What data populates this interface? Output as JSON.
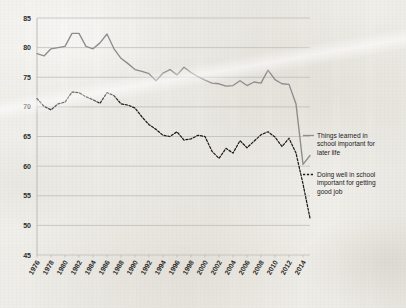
{
  "chart_data": {
    "type": "line",
    "title": "",
    "xlabel": "",
    "ylabel": "",
    "xlim": [
      1976,
      2015
    ],
    "ylim": [
      45,
      85
    ],
    "ytick_step": 5,
    "grid": true,
    "legend_position": "right",
    "yticks": [
      "45",
      "50",
      "55",
      "60",
      "65",
      "70",
      "75",
      "80",
      "85"
    ],
    "xticks": [
      "1976",
      "1978",
      "1980",
      "1982",
      "1984",
      "1986",
      "1988",
      "1990",
      "1992",
      "1994",
      "1996",
      "1998",
      "2000",
      "2002",
      "2004",
      "2006",
      "2008",
      "2010",
      "2012",
      "2014"
    ],
    "x": [
      1976,
      1977,
      1978,
      1979,
      1980,
      1981,
      1982,
      1983,
      1984,
      1985,
      1986,
      1987,
      1988,
      1989,
      1990,
      1991,
      1992,
      1993,
      1994,
      1995,
      1996,
      1997,
      1998,
      1999,
      2000,
      2001,
      2002,
      2003,
      2004,
      2005,
      2006,
      2007,
      2008,
      2009,
      2010,
      2011,
      2012,
      2013,
      2014,
      2015
    ],
    "series": [
      {
        "name": "Things learned in school important for later life",
        "style": "solid",
        "color": "#8d8d8d",
        "values": [
          79.0,
          78.6,
          79.8,
          80.0,
          80.2,
          82.4,
          82.4,
          80.2,
          79.8,
          80.8,
          82.3,
          79.8,
          78.2,
          77.3,
          76.3,
          76.0,
          75.6,
          74.4,
          75.7,
          76.3,
          75.4,
          76.7,
          75.8,
          75.1,
          74.5,
          74.0,
          73.9,
          73.5,
          73.6,
          74.4,
          73.6,
          74.2,
          74.0,
          76.2,
          74.6,
          73.9,
          73.8,
          70.5,
          60.3,
          61.8
        ]
      },
      {
        "name": "Doing well in school important for getting good job",
        "style": "dashed",
        "color": "#1f1d1c",
        "values": [
          71.4,
          70.1,
          69.5,
          70.5,
          70.8,
          72.5,
          72.4,
          71.7,
          71.2,
          70.6,
          72.4,
          71.9,
          70.5,
          70.3,
          69.8,
          68.3,
          67.0,
          66.2,
          65.2,
          65.0,
          65.8,
          64.4,
          64.6,
          65.2,
          65.0,
          62.5,
          61.3,
          63.0,
          62.2,
          64.3,
          63.1,
          64.2,
          65.3,
          65.8,
          64.9,
          63.3,
          64.7,
          62.2,
          57.0,
          51.2
        ]
      }
    ],
    "legend": [
      {
        "label_line1": "Things learned in",
        "label_line2": "school important for",
        "label_line3": "later life",
        "style": "solid"
      },
      {
        "label_line1": "Doing well in school",
        "label_line2": "important for getting",
        "label_line3": "good job",
        "style": "dashed"
      }
    ]
  }
}
